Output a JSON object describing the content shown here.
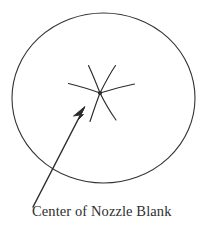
{
  "figure": {
    "caption": "Center of Nozzle Blank",
    "background_color": "#ffffff",
    "ink_color": "#333333",
    "caption_color": "#2e2e2e"
  },
  "diagram": {
    "type": "technical-line-drawing",
    "outline": {
      "name": "nozzle blank outline",
      "shape": "ellipse",
      "cx": 103.5,
      "cy": 98,
      "rx": 91.5,
      "ry": 85,
      "stroke_width": 1.1,
      "fill": "none"
    },
    "star": {
      "name": "center star crack pattern",
      "center_x": 100,
      "center_y": 93,
      "spoke_count": 6,
      "spoke_style": "curved-arc",
      "spoke_paths": [
        "M100,93 C96,83 92,74 88,66",
        "M100,93 C105,83 110,74 116,66",
        "M100,93 C90,89 80,86 69,83",
        "M100,93 C111,89 122,86 134,84",
        "M100,93 C96,102 93,111 90,121",
        "M100,93 C105,102 110,111 116,120"
      ],
      "stroke_width": 1.1,
      "center_dot_radius": 2.2
    },
    "leader_arrow": {
      "name": "leader arrow to center",
      "tail_x": 33,
      "tail_y": 207,
      "tip_x": 85,
      "tip_y": 107,
      "stroke_width": 1.4,
      "head_length": 13,
      "head_width": 5
    }
  }
}
